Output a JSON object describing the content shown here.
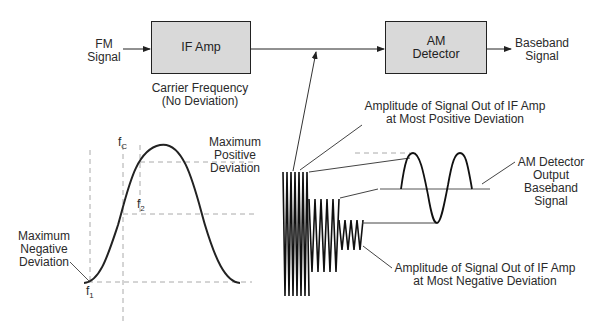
{
  "diagram": {
    "blocks": {
      "if_amp": "IF Amp",
      "am_detector_line1": "AM",
      "am_detector_line2": "Detector"
    },
    "inputs": {
      "fm_signal_line1": "FM",
      "fm_signal_line2": "Signal"
    },
    "outputs": {
      "baseband_line1": "Baseband",
      "baseband_line2": "Signal"
    },
    "carrier_note": {
      "line1": "Carrier Frequency",
      "line2": "(No Deviation)"
    },
    "response_curve": {
      "fc_label": "f",
      "fc_sub": "C",
      "f1_label": "f",
      "f1_sub": "1",
      "f2_label": "f",
      "f2_sub": "2",
      "max_positive": [
        "Maximum",
        "Positive",
        "Deviation"
      ],
      "max_negative": [
        "Maximum",
        "Negative",
        "Deviation"
      ]
    },
    "annotations": {
      "most_positive": [
        "Amplitude of Signal Out of IF Amp",
        "at Most Positive Deviation"
      ],
      "most_negative": [
        "Amplitude of Signal Out of IF Amp",
        "at Most Negative Deviation"
      ],
      "detector_output": [
        "AM Detector",
        "Output",
        "Baseband",
        "Signal"
      ]
    },
    "colors": {
      "block_fill": "#d9d9d9",
      "stroke": "#222222",
      "dashed": "#aaaaaa",
      "leader": "#555555"
    }
  }
}
